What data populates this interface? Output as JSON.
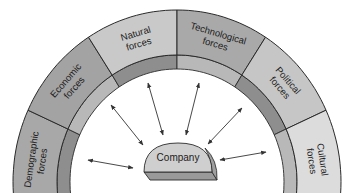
{
  "diagram": {
    "type": "arch-environment",
    "center": {
      "label": "Company",
      "fill": "#cfcfcf"
    },
    "segments": [
      {
        "line1": "Demographic",
        "line2": "forces",
        "fill": "#a8a8a8"
      },
      {
        "line1": "Economic",
        "line2": "forces",
        "fill": "#a3a3a3"
      },
      {
        "line1": "Natural",
        "line2": "forces",
        "fill": "#c9c9c9"
      },
      {
        "line1": "Technological",
        "line2": "forces",
        "fill": "#a9a9a9"
      },
      {
        "line1": "Political",
        "line2": "forces",
        "fill": "#c6c6c6"
      },
      {
        "line1": "Cultural",
        "line2": "forces",
        "fill": "#dcdcdc"
      }
    ],
    "arrows": {
      "count": 7,
      "style": "double-headed",
      "color": "#333333"
    },
    "colors": {
      "outline": "#2a2a2a",
      "inner_band_dark": "#8e8e8e",
      "inner_band_light": "#b8b8b8",
      "background": "#ffffff"
    }
  }
}
